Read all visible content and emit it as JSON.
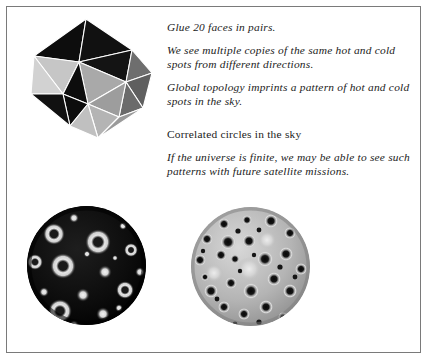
{
  "page": {
    "background_color": "#ffffff",
    "frame_color": "#7a7a7a",
    "width": 429,
    "height": 361
  },
  "figure": {
    "polyhedron": {
      "name": "icosahedron",
      "face_count": 20,
      "face_colors": {
        "dark": "#0d0d0d",
        "light": "#c9c9c9",
        "mid": "#6e6e6e",
        "midlight": "#a6a6a6",
        "edge": "#ffffff"
      }
    },
    "sphere_dark": {
      "name": "cmb-sphere-dark",
      "background_color": "#0a0a0a",
      "spot_color": "#e8e8e8",
      "description": "dark celestial sphere with bright ring-shaped hot and cold spots"
    },
    "sphere_light": {
      "name": "cmb-sphere-light",
      "background_color": "#b9b9b9",
      "spot_color": "#101010",
      "description": "light celestial sphere with dark repeating spot pattern"
    }
  },
  "text": {
    "lines": [
      "Glue 20 faces in pairs.",
      "We see multiple copies of the same hot and cold spots from different directions.",
      "Global topology imprints a pattern of hot and cold spots in the sky.",
      "Correlated circles in the sky",
      "If the universe is finite, we may be able to see such patterns with future satellite missions."
    ]
  }
}
